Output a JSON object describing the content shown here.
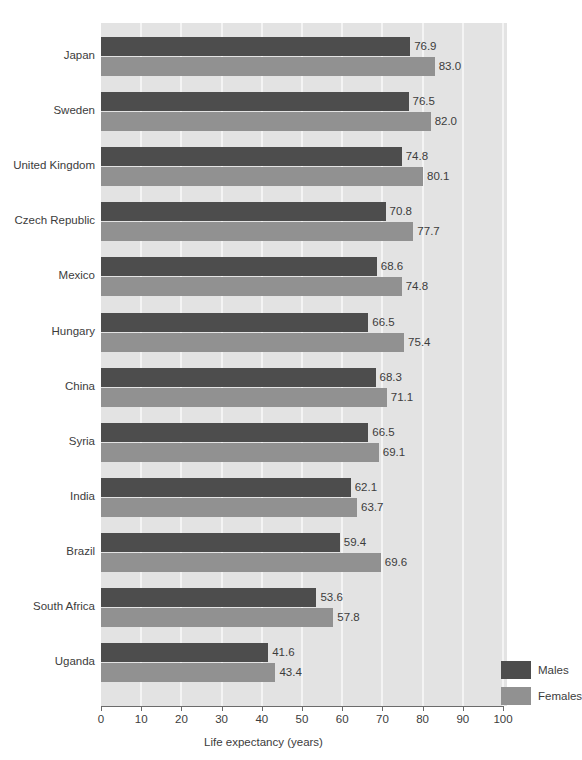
{
  "chart_data": {
    "type": "bar",
    "orientation": "horizontal",
    "title": "",
    "xlabel": "Life expectancy (years)",
    "ylabel": "",
    "xlim": [
      0,
      100
    ],
    "xticks": [
      0,
      10,
      20,
      30,
      40,
      50,
      60,
      70,
      80,
      90,
      100
    ],
    "grid": true,
    "legend_position": "inside-bottom-right",
    "categories": [
      "Japan",
      "Sweden",
      "United Kingdom",
      "Czech Republic",
      "Mexico",
      "Hungary",
      "China",
      "Syria",
      "India",
      "Brazil",
      "South Africa",
      "Uganda"
    ],
    "series": [
      {
        "name": "Males",
        "color": "#4d4d4d",
        "values": [
          76.9,
          76.5,
          74.8,
          70.8,
          68.6,
          66.5,
          68.3,
          66.5,
          62.1,
          59.4,
          53.6,
          41.6
        ],
        "labels": [
          "76.9",
          "76.5",
          "74.8",
          "70.8",
          "68.6",
          "66.5",
          "68.3",
          "66.5",
          "62.1",
          "59.4",
          "53.6",
          "41.6"
        ]
      },
      {
        "name": "Females",
        "color": "#919191",
        "values": [
          83.0,
          82.0,
          80.1,
          77.7,
          74.8,
          75.4,
          71.1,
          69.1,
          63.7,
          69.6,
          57.8,
          43.4
        ],
        "labels": [
          "83.0",
          "82.0",
          "80.1",
          "77.7",
          "74.8",
          "75.4",
          "71.1",
          "69.1",
          "63.7",
          "69.6",
          "57.8",
          "43.4"
        ]
      }
    ]
  },
  "legend": {
    "items": [
      {
        "label": "Males",
        "color": "#4d4d4d"
      },
      {
        "label": "Females",
        "color": "#919191"
      }
    ]
  },
  "axis": {
    "x_title": "Life expectancy (years)",
    "tick_labels": [
      "0",
      "10",
      "20",
      "30",
      "40",
      "50",
      "60",
      "70",
      "80",
      "90",
      "100"
    ]
  },
  "colors": {
    "plot_background": "#e3e3e3",
    "gridline": "#f4f4f4",
    "axis": "#6b6b6b",
    "text": "#3c3c3c",
    "males": "#4d4d4d",
    "females": "#919191"
  }
}
